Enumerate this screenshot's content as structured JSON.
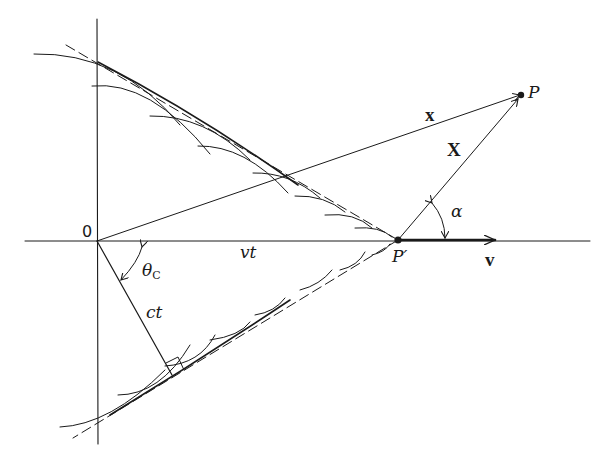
{
  "figure": {
    "type": "cherenkov-cone-geometry",
    "colors": {
      "ink": "#1a1a1a",
      "background": "#ffffff"
    },
    "labels": {
      "origin": "0",
      "vt": "vt",
      "ct": "ct",
      "theta": "θ",
      "theta_sub": "C",
      "x_vector": "x",
      "X_vector": "X",
      "alpha": "α",
      "P": "P",
      "P_prime": "P′",
      "v_vector": "v"
    }
  }
}
